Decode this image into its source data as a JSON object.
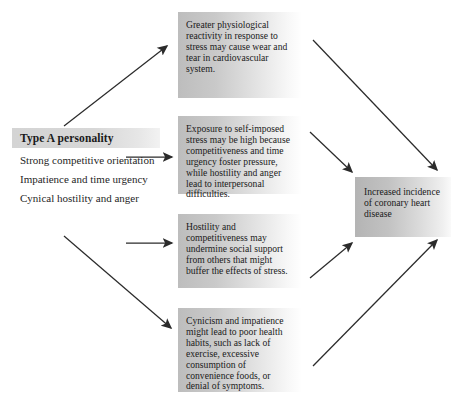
{
  "diagram": {
    "source_box": {
      "header": "Type A personality",
      "traits": [
        "Strong competitive orientation",
        "Impatience and time urgency",
        "Cynical hostility and anger"
      ]
    },
    "mechanism_boxes": [
      {
        "id": "physiological-reactivity",
        "text": "Greater physiological reactivity in response to stress may cause wear and tear in cardiovascular system."
      },
      {
        "id": "self-imposed-stress",
        "text": "Exposure to self-imposed stress may be high because competitiveness and time urgency foster pressure, while hostility and anger lead to interpersonal difficulties."
      },
      {
        "id": "social-support",
        "text": "Hostility and competitiveness may undermine social support from others that might buffer the effects of stress."
      },
      {
        "id": "health-habits",
        "text": "Cynicism and impatience might lead to poor health habits, such as lack of exercise, excessive consumption of convenience foods, or denial of symptoms."
      }
    ],
    "outcome_box": {
      "id": "coronary-heart-disease",
      "text": "Increased incidence of coronary heart disease"
    },
    "arrows": [
      {
        "name": "arrow-source-to-physiological-reactivity"
      },
      {
        "name": "arrow-source-to-self-imposed-stress"
      },
      {
        "name": "arrow-source-to-social-support"
      },
      {
        "name": "arrow-source-to-health-habits"
      },
      {
        "name": "arrow-physiological-reactivity-to-outcome"
      },
      {
        "name": "arrow-self-imposed-stress-to-outcome"
      },
      {
        "name": "arrow-social-support-to-outcome"
      },
      {
        "name": "arrow-health-habits-to-outcome"
      }
    ],
    "colors": {
      "box_fill_dark": "#bdbdbd",
      "box_fill_light": "#ffffff",
      "header_fill": "#d6d6d6",
      "text": "#1a1a1a",
      "arrow": "#2b2b2b",
      "background": "#ffffff"
    }
  }
}
